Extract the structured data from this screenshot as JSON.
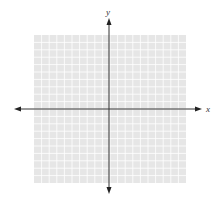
{
  "diagram": {
    "type": "coordinate-plane",
    "x_axis_label": "x",
    "y_axis_label": "y",
    "grid": {
      "columns": 20,
      "rows": 20,
      "background": "#e6e6e6",
      "line_color": "#ffffff"
    },
    "axis_color": "#333333"
  }
}
